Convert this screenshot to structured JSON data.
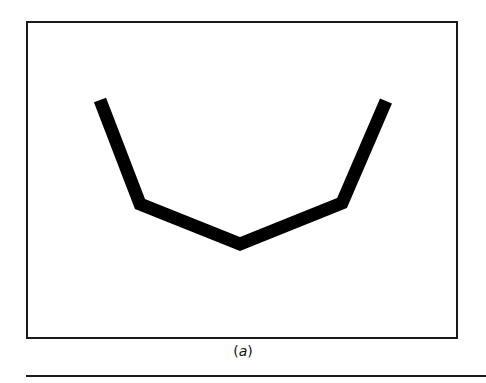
{
  "figure": {
    "caption_open": "(",
    "caption_label": "a",
    "caption_close": ")",
    "frame": {
      "x": 27,
      "y": 22,
      "width": 430,
      "height": 316,
      "stroke": "#1a1a1a",
      "stroke_width": 2
    },
    "polyline": {
      "points": "100,100 140,204 240,244 342,203 386,101",
      "stroke": "#000000",
      "stroke_width": 13
    },
    "rule": {
      "x1": 26,
      "y1": 376,
      "x2": 486,
      "y2": 376,
      "stroke": "#1a1a1a",
      "stroke_width": 2
    }
  }
}
